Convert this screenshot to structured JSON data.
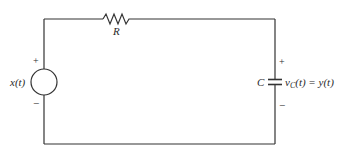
{
  "diagram": {
    "type": "circuit",
    "source": {
      "label": "x(t)",
      "plus": "+",
      "minus": "−"
    },
    "resistor": {
      "label": "R"
    },
    "capacitor": {
      "label": "C",
      "voltage_label_v": "v",
      "voltage_label_sub": "C",
      "voltage_label_rest": "(t) = y(t)",
      "plus": "+",
      "minus": "−"
    },
    "colors": {
      "wire": "#333333",
      "text": "#2a2a2a",
      "background": "#ffffff"
    }
  }
}
